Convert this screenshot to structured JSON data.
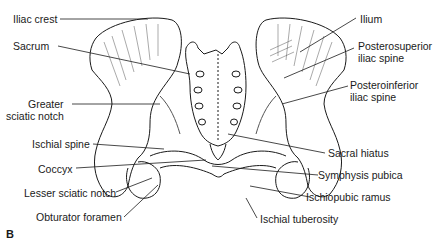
{
  "figure": {
    "panel_label": "B",
    "labels_left": [
      {
        "id": "iliac-crest",
        "text": "Iliac crest"
      },
      {
        "id": "sacrum",
        "text": "Sacrum"
      },
      {
        "id": "greater-sciatic-notch",
        "line1": "Greater",
        "line2": "sciatic notch"
      },
      {
        "id": "ischial-spine",
        "text": "Ischial spine"
      },
      {
        "id": "coccyx",
        "text": "Coccyx"
      },
      {
        "id": "lesser-sciatic-notch",
        "text": "Lesser sciatic notch"
      },
      {
        "id": "obturator-foramen",
        "text": "Obturator foramen"
      }
    ],
    "labels_right": [
      {
        "id": "ilium",
        "text": "Ilium"
      },
      {
        "id": "posterosuperior-iliac-spine",
        "line1": "Posterosuperior",
        "line2": "iliac spine"
      },
      {
        "id": "posteroinferior-iliac-spine",
        "line1": "Posteroinferior",
        "line2": "iliac spine"
      },
      {
        "id": "sacral-hiatus",
        "text": "Sacral hiatus"
      },
      {
        "id": "symphysis-pubica",
        "text": "Symphysis pubica"
      },
      {
        "id": "ischiopubic-ramus",
        "text": "Ischiopubic ramus"
      },
      {
        "id": "ischial-tuberosity",
        "text": "Ischial tuberosity"
      }
    ],
    "colors": {
      "ink": "#1a1a1a",
      "shade": "#555555",
      "background": "#ffffff"
    }
  }
}
